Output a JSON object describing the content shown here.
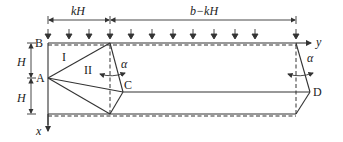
{
  "figure": {
    "type": "mechanism-diagram",
    "dimensions": {
      "left_width": "kH",
      "right_width": "b−kH",
      "upper_height": "H",
      "lower_height": "H"
    },
    "points": {
      "A": "A",
      "B": "B",
      "C": "C",
      "D": "D"
    },
    "regions": {
      "I": "I",
      "II": "II"
    },
    "angles": {
      "alpha_left": "α",
      "alpha_right": "α"
    },
    "axes": {
      "x": "x",
      "y": "y"
    },
    "load_arrows_count": 12,
    "colors": {
      "stroke": "#333333",
      "text": "#222222",
      "background": "#ffffff"
    }
  }
}
